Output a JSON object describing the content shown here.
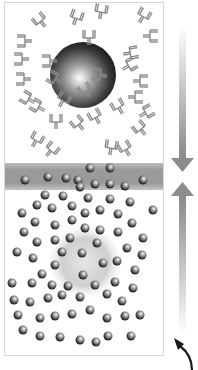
{
  "diagram": {
    "title": "",
    "colors": {
      "background": "#ffffff",
      "frame": "#d8d8d8",
      "antibody": "#8a8a8a",
      "band": "#9a9a9a",
      "sphere_dark": "#1e1e1e",
      "sphere_light": "#ffffff",
      "particle_dark": "#2a2a2a",
      "arrow": "#8c8c8c",
      "curved_arrow": "#1a1a1a"
    },
    "frame": {
      "x": 4,
      "y": 2,
      "w": 159,
      "h": 353
    },
    "band": {
      "y": 163,
      "h": 27
    },
    "large_sphere_top": {
      "cx": 83,
      "cy": 75,
      "r": 33
    },
    "large_sphere_bottom": {
      "cx": 85,
      "cy": 262,
      "r": 33,
      "faded": true
    },
    "arrow_down": {
      "x": 182,
      "y1": 25,
      "y2": 172
    },
    "arrow_up": {
      "x": 182,
      "y1": 182,
      "y2": 335
    },
    "curved_arrow": {
      "x": 182,
      "y": 345
    },
    "labels": []
  }
}
